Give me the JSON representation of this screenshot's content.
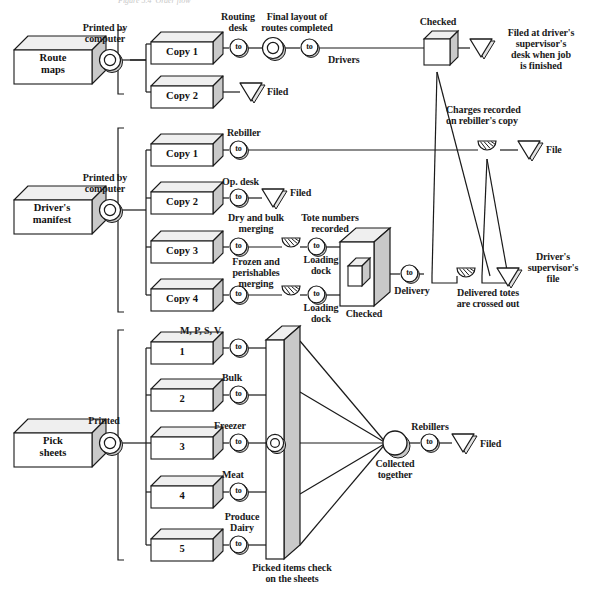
{
  "figure": {
    "caption_top": "Figure 5.4  Order flow",
    "stroke": "#1a1a1a",
    "face_fill": "#ffffff",
    "side_fill": "#c9c9c9",
    "top_fill": "#efefef"
  },
  "sources": [
    {
      "id": "route-maps",
      "label": "Route\nmaps",
      "op_label": "Printed by\ncomputer"
    },
    {
      "id": "drivers-manifest",
      "label": "Driver's\nmanifest",
      "op_label": "Printed by\ncomputer"
    },
    {
      "id": "pick-sheets",
      "label": "Pick\nsheets",
      "op_label": "Printed"
    }
  ],
  "group_route": {
    "copies": [
      {
        "label": "Copy 1"
      },
      {
        "label": "Copy 2"
      }
    ],
    "labels": {
      "routing_desk": "Routing\ndesk",
      "final_layout": "Final layout of\nroutes completed",
      "drivers": "Drivers",
      "checked": "Checked",
      "filed_supervisor": "Filed at driver's\nsupervisor's\ndesk when job\nis finished",
      "filed": "Filed",
      "charges_recorded": "Charges recorded\non rebiller's copy"
    }
  },
  "group_manifest": {
    "copies": [
      {
        "label": "Copy 1"
      },
      {
        "label": "Copy 2"
      },
      {
        "label": "Copy 3"
      },
      {
        "label": "Copy 4"
      }
    ],
    "labels": {
      "rebiller": "Rebiller",
      "op_desk": "Op. desk",
      "filed": "Filed",
      "file": "File",
      "dry_bulk": "Dry and bulk\nmerging",
      "frozen_perishables": "Frozen and\nperishables\nmerging",
      "tote_numbers": "Tote numbers\nrecorded",
      "loading_dock_1": "Loading\ndock",
      "loading_dock_2": "Loading\ndock",
      "checked": "Checked",
      "delivery": "Delivery",
      "delivered_totes": "Delivered totes\nare crossed out",
      "supervisor_file": "Driver's\nsupervisor's\nfile"
    }
  },
  "group_pick": {
    "sheets": [
      {
        "label": "1",
        "op": "M, P, S, V"
      },
      {
        "label": "2",
        "op": "Bulk"
      },
      {
        "label": "3",
        "op": "Freezer"
      },
      {
        "label": "4",
        "op": "Meat"
      },
      {
        "label": "5",
        "op": "Produce\nDairy"
      }
    ],
    "labels": {
      "picked_items": "Picked items check\non the sheets",
      "collected_together": "Collected\ntogether",
      "rebillers": "Rebillers",
      "filed": "Filed"
    }
  },
  "symbols": {
    "operation_to": "to",
    "inspection": "inspection-circle",
    "storage": "storage-triangle",
    "delay": "delay-hatched-semicircle",
    "transport": "transport-box"
  }
}
